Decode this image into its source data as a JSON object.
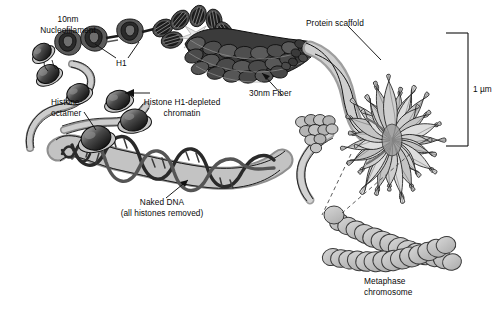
{
  "figure": {
    "background_color": "#ffffff",
    "ink_color": "#000000",
    "fiber_fill": "#b4b4b4",
    "fiber_dark": "#3c3c3c",
    "chromosome_fill": "#bfbfbf",
    "scaffold_fill": "#9a9a9a"
  },
  "labels": {
    "nucleofilament": {
      "line1": "10nm",
      "line2": "Nucleofilament"
    },
    "h1": "H1",
    "histone_octamer": {
      "line1": "Histone",
      "line2": "octamer"
    },
    "h1_depleted": {
      "line1": "Histone H1-depleted",
      "line2": "chromatin"
    },
    "fiber_30nm": "30nm Fiber",
    "protein_scaffold": "Protein scaffold",
    "naked_dna": {
      "line1": "Naked DNA",
      "line2": "(all histones removed)"
    },
    "metaphase": {
      "line1": "Metaphase",
      "line2": "chromosome"
    },
    "scale_bar": "1 µm"
  },
  "scale_bar": {
    "value": "1 µm",
    "x": 468,
    "y_top": 33,
    "y_bottom": 146,
    "tick_length": 22
  },
  "structures": [
    {
      "name": "naked-dna-ribbon",
      "description": "wide gray ribbon with dark DNA double helix wound around it",
      "level": 1
    },
    {
      "name": "nucleosome-beads",
      "description": "histone octamer beads on a string",
      "level": 2
    },
    {
      "name": "nucleofilament-10nm",
      "description": "10nm nucleofilament with H1 linker histones",
      "level": 3
    },
    {
      "name": "fiber-30nm",
      "description": "30nm solenoid fiber of stacked nucleosomes",
      "level": 4
    },
    {
      "name": "looped-domains",
      "description": "radial loop rosette anchored on protein scaffold",
      "level": 5
    },
    {
      "name": "metaphase-chromosome",
      "description": "condensed metaphase chromosome with two crossing chromatid arms",
      "level": 6
    }
  ]
}
